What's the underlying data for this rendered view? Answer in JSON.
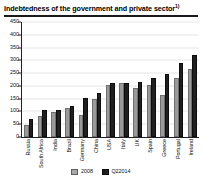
{
  "chart_data": {
    "type": "bar",
    "title": "Indebtedness of the government and private sector",
    "title_footnote_marker": "1)",
    "xlabel": "",
    "ylabel": "",
    "ylim": [
      0,
      450
    ],
    "ytick_step": 50,
    "yticks": [
      450,
      400,
      350,
      300,
      250,
      200,
      150,
      100,
      50,
      0
    ],
    "grid": true,
    "legend_position": "bottom-center",
    "categories": [
      "Russia",
      "South Africa",
      "India",
      "Brazil",
      "Germany",
      "China",
      "USA",
      "Italy",
      "UK",
      "Spain",
      "Greece",
      "Portugal",
      "Ireland"
    ],
    "series": [
      {
        "name": "2008",
        "color": "#9a9a9a",
        "values": [
          48,
          84,
          98,
          112,
          86,
          150,
          204,
          210,
          190,
          204,
          165,
          230,
          265
        ]
      },
      {
        "name": "Q22014",
        "color": "#1f1f1f",
        "values": [
          72,
          105,
          105,
          120,
          152,
          172,
          212,
          212,
          215,
          230,
          245,
          290,
          322
        ]
      }
    ]
  },
  "legend": {
    "items": [
      {
        "label": "2008",
        "swatch": "legend-swatch-2008"
      },
      {
        "label": "Q22014",
        "swatch": "legend-swatch-q22014"
      }
    ]
  }
}
